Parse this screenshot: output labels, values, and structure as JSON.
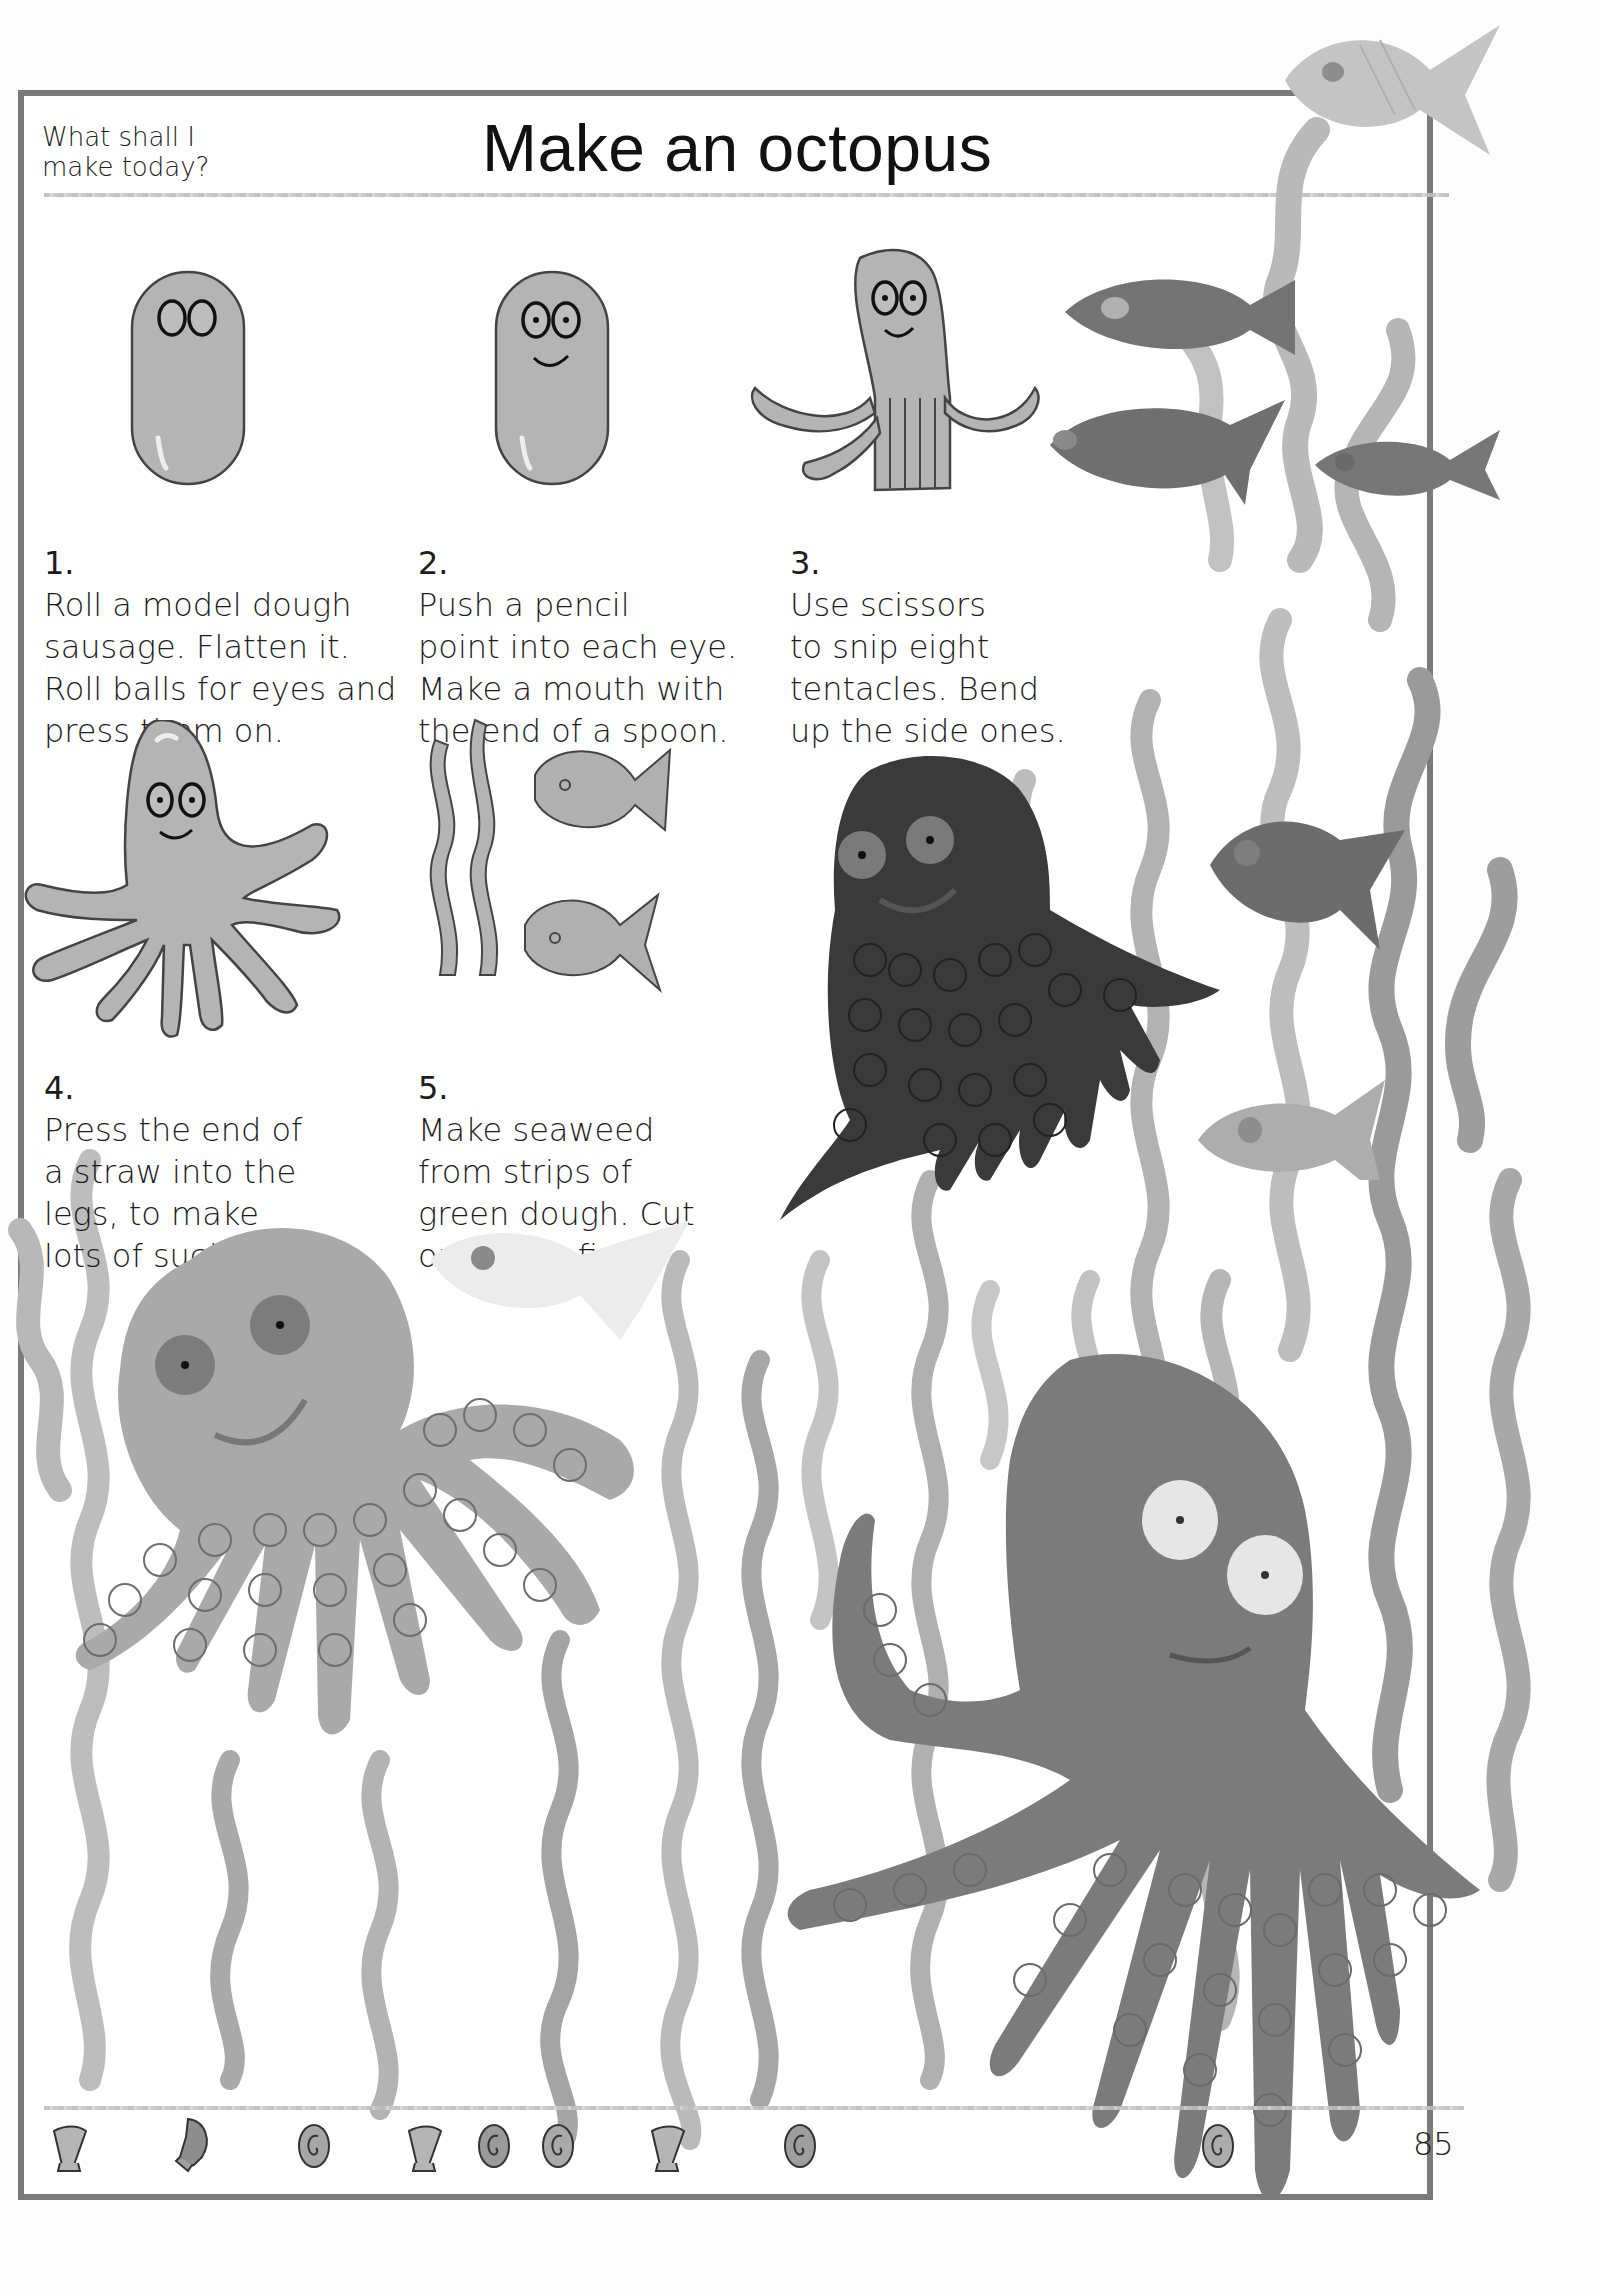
{
  "header": {
    "kicker_line1": "What shall I",
    "kicker_line2": "make today?",
    "title": "Make an octopus"
  },
  "steps": [
    {
      "number": "1.",
      "text": "Roll a model dough\nsausage. Flatten it.\nRoll balls for eyes and\npress them on.",
      "illustration": "dough-sausage-with-eyes"
    },
    {
      "number": "2.",
      "text": "Push a pencil\npoint into each eye.\nMake a mouth with\nthe end of a spoon.",
      "illustration": "dough-sausage-with-face"
    },
    {
      "number": "3.",
      "text": "Use scissors\nto snip eight\ntentacles. Bend\nup the side ones.",
      "illustration": "octopus-snipped-tentacles"
    },
    {
      "number": "4.",
      "text": "Press the end of\na straw into the\n      legs, to make\n      lots of suckers.",
      "illustration": "octopus-eight-legs"
    },
    {
      "number": "5.",
      "text": "Make seaweed\nfrom strips of\ngreen dough. Cut\nout some fish.",
      "illustration": "seaweed-and-fish"
    }
  ],
  "photos": [
    {
      "subject": "dark-octopus-with-suckers"
    },
    {
      "subject": "light-octopus-with-suckers"
    },
    {
      "subject": "large-octopus-white-eyes"
    },
    {
      "subject": "fish-school-and-seaweed"
    }
  ],
  "footer": {
    "shells": [
      "scallop-shell",
      "conch-shell",
      "spiral-shell",
      "scallop-shell",
      "spiral-shell",
      "spiral-shell",
      "scallop-shell",
      "spiral-shell",
      "spiral-shell"
    ],
    "page_number": "85"
  },
  "colors": {
    "frame": "#7a7a7a",
    "dough_light": "#b4b4b4",
    "dough_mid": "#8c8c8c",
    "dough_dark": "#3a3a3a",
    "seaweed": "#a9a9a9"
  }
}
